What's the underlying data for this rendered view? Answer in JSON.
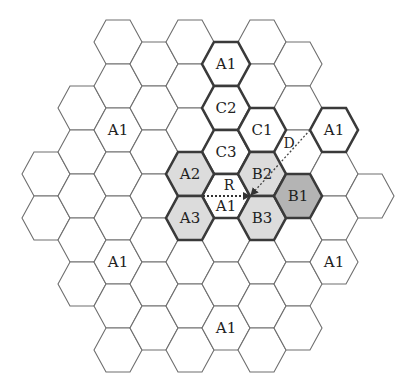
{
  "figure": {
    "type": "hexagonal cellular layout with reuse clusters",
    "geometry": {
      "origin_x": 226,
      "origin_y": 196,
      "col_spacing": 36,
      "row_height": 44,
      "radius": 24,
      "half_height": 22
    },
    "colors": {
      "shade_light": "#dcdcdc",
      "shade_dark": "#b4b4b4",
      "line": "#6e6e6e",
      "thick_line": "#3a3a3a"
    },
    "columns": [
      {
        "col": -5,
        "rows_y": [
          174,
          218
        ]
      },
      {
        "col": -4,
        "rows_y": [
          108,
          152,
          196,
          240,
          284
        ]
      },
      {
        "col": -3,
        "rows_y": [
          42,
          86,
          130,
          174,
          218,
          262,
          306,
          350
        ]
      },
      {
        "col": -2,
        "rows_y": [
          64,
          108,
          152,
          196,
          240,
          284,
          328
        ]
      },
      {
        "col": -1,
        "rows_y": [
          42,
          86,
          130,
          174,
          218,
          262,
          306,
          350
        ]
      },
      {
        "col": 0,
        "rows_y": [
          64,
          108,
          152,
          196,
          240,
          284,
          328
        ]
      },
      {
        "col": 1,
        "rows_y": [
          42,
          86,
          130,
          174,
          218,
          262,
          306,
          350
        ]
      },
      {
        "col": 2,
        "rows_y": [
          64,
          108,
          152,
          196,
          240,
          284,
          328
        ]
      },
      {
        "col": 3,
        "rows_y": [
          130,
          174,
          218,
          262
        ]
      },
      {
        "col": 4,
        "rows_y": [
          196
        ]
      }
    ],
    "labeled_cells": [
      {
        "label": "A1",
        "col": 0,
        "y": 64,
        "shade": "none",
        "thick": true
      },
      {
        "label": "C2",
        "col": 0,
        "y": 108,
        "shade": "none",
        "thick": true
      },
      {
        "label": "C3",
        "col": 0,
        "y": 152,
        "shade": "none",
        "thick": true
      },
      {
        "label": "A1",
        "col": 0,
        "y": 196,
        "shade": "none",
        "thick": true
      },
      {
        "label": "C1",
        "col": 1,
        "y": 130,
        "shade": "none",
        "thick": true
      },
      {
        "label": "A2",
        "col": -1,
        "y": 174,
        "shade": "light",
        "thick": true
      },
      {
        "label": "A3",
        "col": -1,
        "y": 218,
        "shade": "light",
        "thick": true
      },
      {
        "label": "B2",
        "col": 1,
        "y": 174,
        "shade": "light",
        "thick": true
      },
      {
        "label": "B3",
        "col": 1,
        "y": 218,
        "shade": "light",
        "thick": true
      },
      {
        "label": "B1",
        "col": 2,
        "y": 196,
        "shade": "dark",
        "thick": true
      },
      {
        "label": "A1",
        "col": 3,
        "y": 130,
        "shade": "none",
        "thick": true
      },
      {
        "label": "A1",
        "col": -3,
        "y": 130,
        "shade": "none",
        "thick": false
      },
      {
        "label": "A1",
        "col": -3,
        "y": 262,
        "shade": "none",
        "thick": false
      },
      {
        "label": "A1",
        "col": 3,
        "y": 262,
        "shade": "none",
        "thick": false
      },
      {
        "label": "A1",
        "col": 0,
        "y": 328,
        "shade": "none",
        "thick": false
      }
    ],
    "arrows": {
      "R": {
        "label": "R",
        "x1": 203,
        "y1": 196,
        "x2": 250,
        "y2": 196,
        "label_x": 229,
        "label_y": 190
      },
      "D": {
        "label": "D",
        "x1": 310,
        "y1": 130,
        "x2": 251,
        "y2": 195,
        "label_x": 289,
        "label_y": 148
      }
    }
  }
}
